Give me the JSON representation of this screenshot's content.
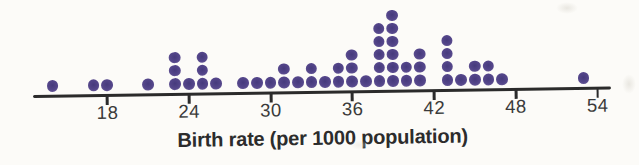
{
  "chart_data": {
    "type": "dotplot",
    "title": "",
    "xlabel": "Birth rate (per 1000 population)",
    "x_tick_values": [
      18,
      24,
      30,
      36,
      42,
      48,
      54
    ],
    "x_axis_shown_range": [
      13,
      55
    ],
    "grid": false,
    "dot_color": "#54468a",
    "total_dots": 54,
    "points": [
      {
        "value": 14,
        "count": 1
      },
      {
        "value": 17,
        "count": 1
      },
      {
        "value": 18,
        "count": 1
      },
      {
        "value": 21,
        "count": 1
      },
      {
        "value": 23,
        "count": 3
      },
      {
        "value": 24,
        "count": 1
      },
      {
        "value": 25,
        "count": 3
      },
      {
        "value": 26,
        "count": 1
      },
      {
        "value": 28,
        "count": 1
      },
      {
        "value": 29,
        "count": 1
      },
      {
        "value": 30,
        "count": 1
      },
      {
        "value": 31,
        "count": 2
      },
      {
        "value": 32,
        "count": 1
      },
      {
        "value": 33,
        "count": 2
      },
      {
        "value": 34,
        "count": 1
      },
      {
        "value": 35,
        "count": 2
      },
      {
        "value": 36,
        "count": 3
      },
      {
        "value": 37,
        "count": 1
      },
      {
        "value": 38,
        "count": 5
      },
      {
        "value": 39,
        "count": 6
      },
      {
        "value": 40,
        "count": 2
      },
      {
        "value": 41,
        "count": 3
      },
      {
        "value": 43,
        "count": 4
      },
      {
        "value": 44,
        "count": 1
      },
      {
        "value": 45,
        "count": 2
      },
      {
        "value": 46,
        "count": 2
      },
      {
        "value": 47,
        "count": 1
      },
      {
        "value": 53,
        "count": 1
      }
    ]
  },
  "colors": {
    "background": "#fcfbf8",
    "axis": "#2b2b2b",
    "tick_label_text": "#3a3a3a",
    "axis_title_text": "#2c2c2c",
    "dot": "#54468a"
  }
}
